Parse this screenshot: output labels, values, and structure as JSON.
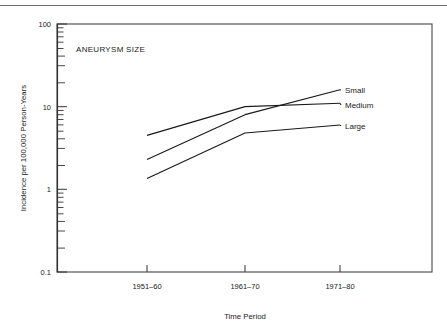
{
  "chart_data": {
    "type": "line",
    "title": "",
    "annotation": "ANEURYSM SIZE",
    "xlabel": "Time Period",
    "ylabel": "Incidence per 100,000 Person-Years",
    "categories": [
      "1951–60",
      "1961–70",
      "1971–80"
    ],
    "yscale": "log",
    "ylim": [
      0.1,
      100
    ],
    "ytick_labels": [
      "100",
      "10",
      "1",
      "0.1"
    ],
    "ytick_values": [
      100,
      10,
      1,
      0.1
    ],
    "grid": false,
    "legend_position": "right-inline",
    "series": [
      {
        "name": "Small",
        "values": [
          2.3,
          8.0,
          16.0
        ]
      },
      {
        "name": "Medium",
        "values": [
          4.5,
          10.0,
          11.0
        ]
      },
      {
        "name": "Large",
        "values": [
          1.35,
          4.8,
          6.0
        ]
      }
    ]
  },
  "axes": {
    "y_title": "Incidence per 100,000 Person-Years",
    "x_title": "Time Period",
    "y_labels": {
      "t100": "100",
      "t10": "10",
      "t1": "1",
      "t01": "0.1"
    },
    "x_labels": {
      "p1": "1951–60",
      "p2": "1961–70",
      "p3": "1971–80"
    }
  },
  "plot": {
    "annotation": "ANEURYSM SIZE"
  },
  "legend": {
    "small": "Small",
    "medium": "Medium",
    "large": "Large"
  },
  "colors": {
    "line": "#1a1a1a",
    "frame": "#555555",
    "rule": "#6d6d6d",
    "background": "#ffffff"
  }
}
